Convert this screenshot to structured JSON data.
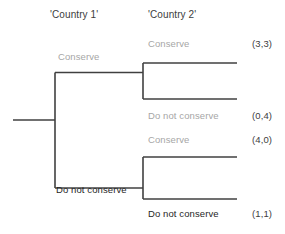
{
  "diagram": {
    "type": "extensive-form-game-tree",
    "title": "",
    "players": [
      {
        "id": "p1",
        "label": "'Country 1'"
      },
      {
        "id": "p2",
        "label": "'Country 2'"
      }
    ],
    "colors": {
      "line": "#404040",
      "gray_text": "#a6a6a6",
      "dark_text": "#262626",
      "header_text": "#3d3d3d",
      "background": "#ffffff"
    },
    "branches": {
      "p1_conserve": "Conserve",
      "p1_not_conserve": "Do not conserve",
      "p2_upper_conserve": "Conserve",
      "p2_upper_not_conserve": "Do not conserve",
      "p2_lower_conserve": "Conserve",
      "p2_lower_not_conserve": "Do not conserve"
    },
    "outcomes": [
      {
        "path": "Conserve / Conserve",
        "payoff": "(3,3)"
      },
      {
        "path": "Conserve / Do not conserve",
        "payoff": "(0,4)"
      },
      {
        "path": "Do not conserve / Conserve",
        "payoff": "(4,0)"
      },
      {
        "path": "Do not conserve / Do not conserve",
        "payoff": "(1,1)"
      }
    ]
  }
}
